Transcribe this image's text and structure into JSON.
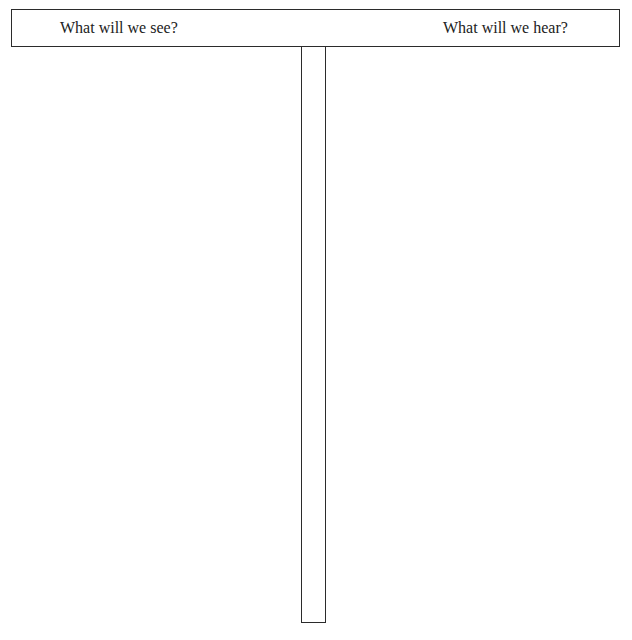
{
  "t_chart": {
    "header": {
      "left_label": "What will we see?",
      "right_label": "What will we hear?"
    },
    "columns": [
      {
        "id": "see",
        "entries": []
      },
      {
        "id": "hear",
        "entries": []
      }
    ],
    "colors": {
      "line": "#2b2b2b",
      "text": "#222222",
      "background": "#ffffff"
    }
  }
}
